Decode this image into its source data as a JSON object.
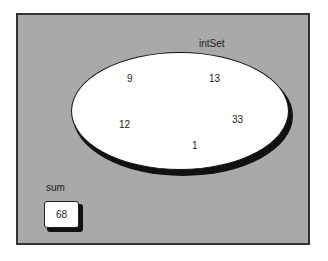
{
  "diagram": {
    "set": {
      "name": "intSet",
      "elements": [
        "9",
        "13",
        "12",
        "33",
        "1"
      ]
    },
    "variable": {
      "name": "sum",
      "value": "68"
    }
  }
}
